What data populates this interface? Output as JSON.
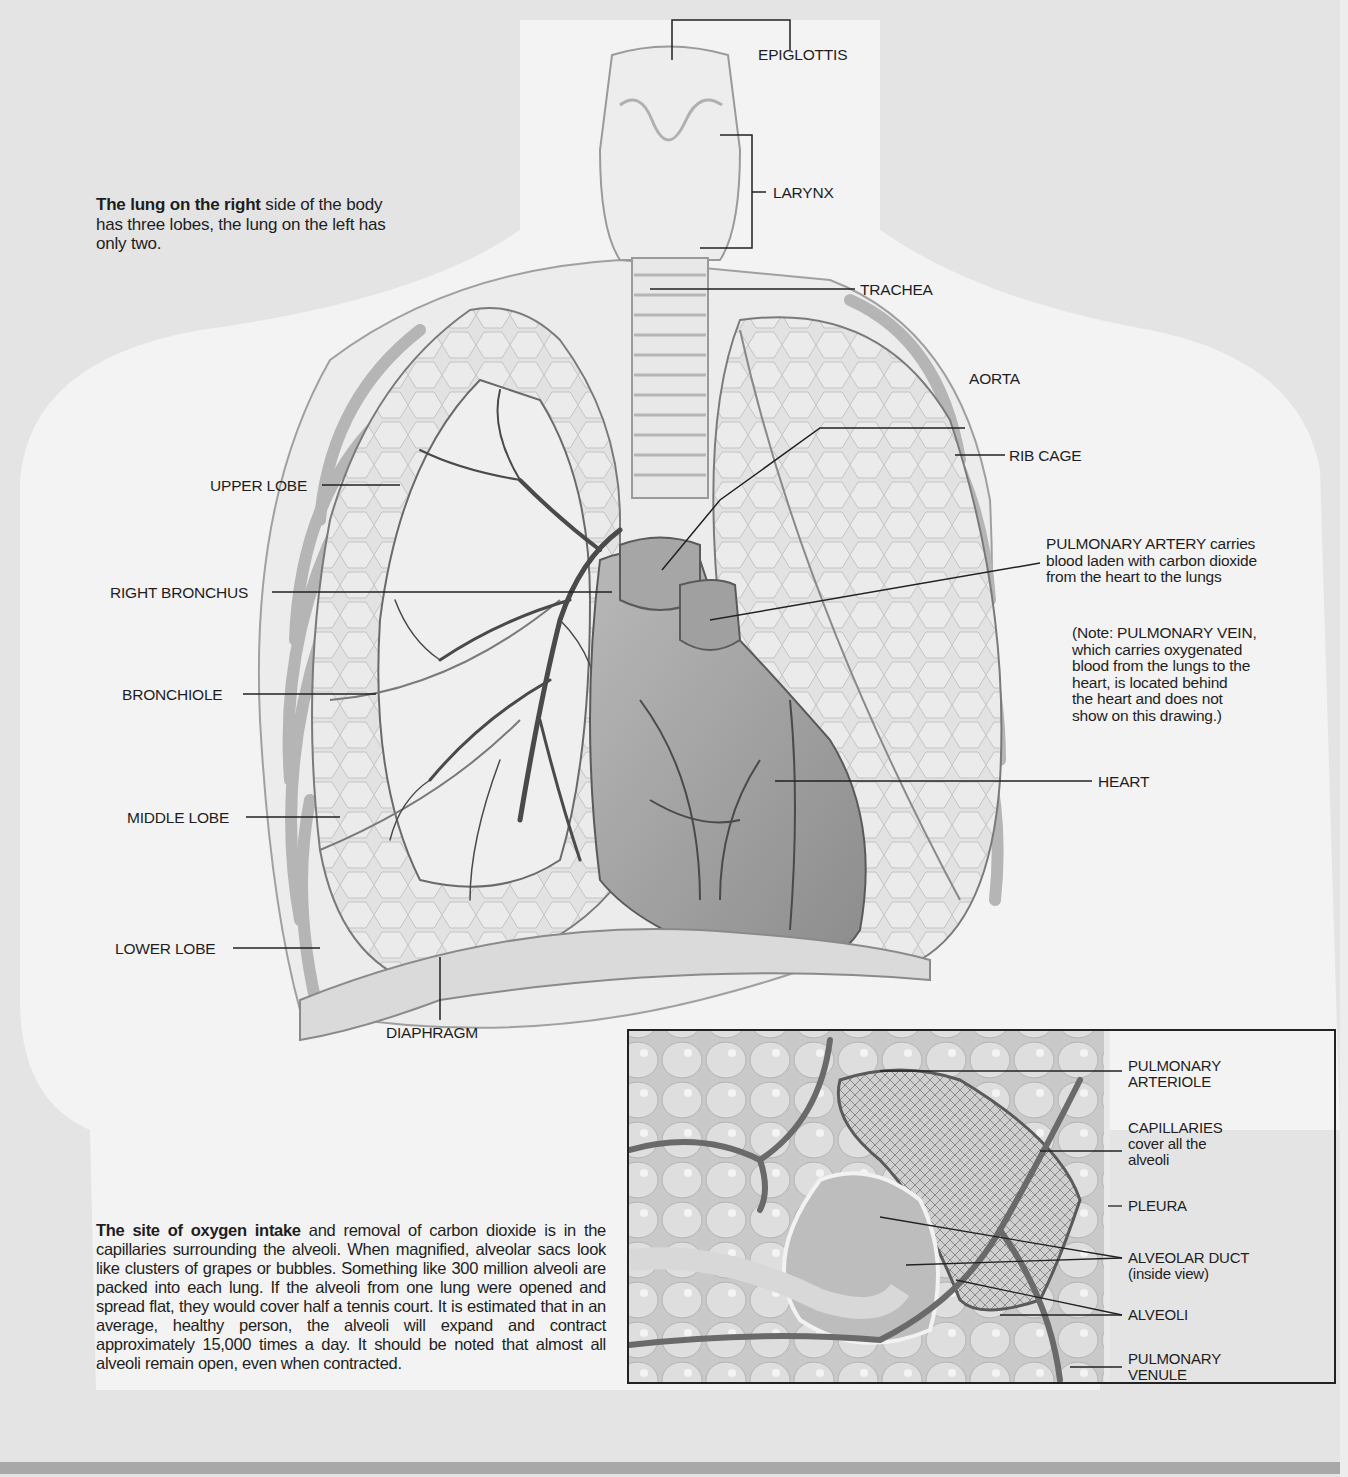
{
  "diagram": {
    "title_caption": {
      "bold": "The lung on the right",
      "rest": " side of the body has three lobes, the lung on the left has only two."
    },
    "main_labels": {
      "epiglottis": "EPIGLOTTIS",
      "larynx": "LARYNX",
      "trachea": "TRACHEA",
      "aorta": "AORTA",
      "rib_cage": "RIB CAGE",
      "pulmonary_artery": {
        "line1": "PULMONARY ARTERY carries",
        "line2": "blood laden with carbon dioxide",
        "line3": "from the heart to the lungs"
      },
      "note": {
        "line1": "(Note: PULMONARY VEIN,",
        "line2": "which carries oxygenated",
        "line3": "blood from the lungs to the",
        "line4": "heart, is located behind",
        "line5": "the heart and does not",
        "line6": "show on this drawing.)"
      },
      "heart": "HEART",
      "upper_lobe": "UPPER LOBE",
      "right_bronchus": "RIGHT BRONCHUS",
      "bronchiole": "BRONCHIOLE",
      "middle_lobe": "MIDDLE LOBE",
      "lower_lobe": "LOWER LOBE",
      "diaphragm": "DIAPHRAGM"
    },
    "inset_labels": {
      "pulmonary_arteriole": {
        "line1": "PULMONARY",
        "line2": "ARTERIOLE"
      },
      "capillaries": {
        "line1": "CAPILLARIES",
        "line2": "cover all the",
        "line3": "alveoli"
      },
      "pleura": "PLEURA",
      "alveolar_duct": {
        "line1": "ALVEOLAR DUCT",
        "line2": "(inside view)"
      },
      "alveoli": "ALVEOLI",
      "pulmonary_venule": {
        "line1": "PULMONARY",
        "line2": "VENULE"
      }
    },
    "body_text": {
      "bold": "The site of oxygen intake",
      "rest": "  and removal of carbon dioxide is in the capillaries surrounding the alveoli. When magnified, alveolar sacs look like clusters of grapes or bubbles. Something like 300 million alveoli are packed into each lung. If the alveoli from one lung were opened and spread flat, they would cover half a tennis court. It is estimated that in an average, healthy person, the alveoli will expand and contract approximately 15,000 times a day. It should be noted that almost all alveoli remain open, even when contracted."
    },
    "colors": {
      "background": "#e4e4e4",
      "torso": "#f4f4f4",
      "lung_fill": "#dcdcdc",
      "heart_fill": "#9a9a9a",
      "vessel": "#6e6e6e",
      "text": "#1e1e1e",
      "bottom_bar": "#a8a8a8"
    }
  }
}
